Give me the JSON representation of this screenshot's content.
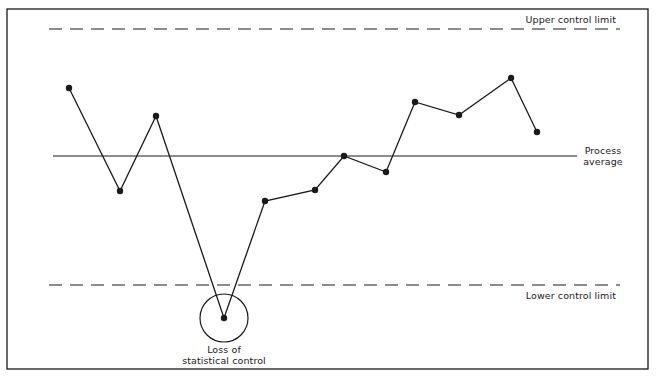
{
  "chart_data": {
    "type": "line",
    "title": "",
    "chart_kind": "control chart",
    "xlabel": "",
    "ylabel": "",
    "grid": false,
    "legend": "none",
    "x": [
      1,
      2,
      3,
      4,
      5,
      6,
      7,
      8,
      9,
      10,
      11,
      12
    ],
    "series": [
      {
        "name": "Process measurements",
        "values": [
          0.52,
          -0.26,
          0.3,
          -1.24,
          -0.34,
          -0.26,
          0.0,
          -0.12,
          0.42,
          0.32,
          0.6,
          0.19
        ]
      }
    ],
    "reference_lines": [
      {
        "name": "Upper control limit",
        "value": 0.99,
        "style": "dashed"
      },
      {
        "name": "Process average",
        "value": 0.0,
        "style": "solid"
      },
      {
        "name": "Lower control limit",
        "value": -0.99,
        "style": "dashed"
      }
    ],
    "annotations": [
      {
        "text": "Loss of statistical control",
        "target_point_index": 3,
        "marker": "circle"
      }
    ],
    "ylim": [
      -1.4,
      1.1
    ],
    "pixel_geometry": {
      "frame": [
        7,
        9,
        648,
        369
      ],
      "ucl": {
        "y": 29,
        "x1": 49,
        "x2": 620
      },
      "lcl": {
        "y": 285,
        "x1": 49,
        "x2": 620
      },
      "avg": {
        "y": 156,
        "x1": 53,
        "x2": 577
      },
      "points": [
        [
          69,
          88
        ],
        [
          120,
          191
        ],
        [
          156,
          116
        ],
        [
          224,
          318
        ],
        [
          265,
          201
        ],
        [
          315,
          190
        ],
        [
          344,
          156
        ],
        [
          386,
          172
        ],
        [
          415,
          102
        ],
        [
          459,
          115
        ],
        [
          511,
          78
        ],
        [
          537,
          132
        ]
      ],
      "circle": {
        "cx": 224,
        "cy": 318,
        "r": 24
      }
    }
  },
  "labels": {
    "ucl": "Upper control limit",
    "avg_line1": "Process",
    "avg_line2": "average",
    "lcl": "Lower control limit",
    "annotation_line1": "Loss of",
    "annotation_line2": "statistical control"
  },
  "colors": {
    "ink": "#1a1a1a",
    "background": "#ffffff"
  }
}
